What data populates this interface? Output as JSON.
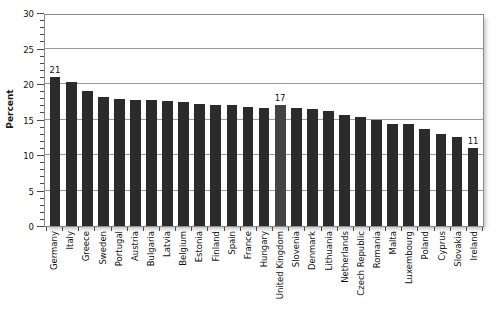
{
  "chart_data": {
    "type": "bar",
    "title": "",
    "xlabel": "",
    "ylabel": "Percent",
    "ylim": [
      0,
      30
    ],
    "ytick_step": 5,
    "yticks": [
      0,
      5,
      10,
      15,
      20,
      25,
      30
    ],
    "ytick_labels": [
      "0",
      "5",
      "10",
      "15",
      "20",
      "25",
      "30"
    ],
    "minor_tick_step": 1,
    "grid": true,
    "grid_axis": "y",
    "legend": "none",
    "bar_color": "#2b2b2b",
    "highlight_color": "#434343",
    "categories": [
      "Germany",
      "Italy",
      "Greece",
      "Sweden",
      "Portugal",
      "Austria",
      "Bulgaria",
      "Latvia",
      "Belgium",
      "Estonia",
      "Finland",
      "Spain",
      "France",
      "Hungary",
      "United Kingdom",
      "Slovenia",
      "Denmark",
      "Lithuania",
      "Netherlands",
      "Czech Republic",
      "Romania",
      "Malta",
      "Luxembourg",
      "Poland",
      "Cyprus",
      "Slovakia",
      "Ireland"
    ],
    "values": [
      21.0,
      20.3,
      19.0,
      18.2,
      17.9,
      17.7,
      17.7,
      17.6,
      17.4,
      17.2,
      17.1,
      17.0,
      16.8,
      16.6,
      17.0,
      16.6,
      16.5,
      16.2,
      15.6,
      15.3,
      14.9,
      14.4,
      14.3,
      13.7,
      13.0,
      12.5,
      11.0
    ],
    "highlighted": [
      "United Kingdom"
    ],
    "data_labels": [
      {
        "category": "Germany",
        "text": "21"
      },
      {
        "category": "United Kingdom",
        "text": "17"
      },
      {
        "category": "Ireland",
        "text": "11"
      }
    ]
  },
  "caption": ""
}
